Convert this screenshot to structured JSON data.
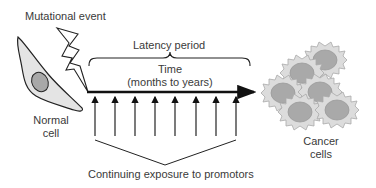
{
  "diagram": {
    "labels": {
      "mutational_event": "Mutational event",
      "latency_period": "Latency period",
      "time": "Time",
      "time_range": "(months to years)",
      "normal_cell_1": "Normal",
      "normal_cell_2": "cell",
      "cancer_cells_1": "Cancer",
      "cancer_cells_2": "cells",
      "promotors": "Continuing exposure to promotors"
    },
    "promotor_arrow_count": 8,
    "colors": {
      "line": "#111111",
      "cell_fill": "#e4e4e4",
      "nucleus_fill": "#a8a8a8",
      "cancer_cell_fill": "#d9d9d9",
      "cancer_nucleus_fill": "#a9a9a9",
      "text": "#3a3a3a"
    }
  }
}
